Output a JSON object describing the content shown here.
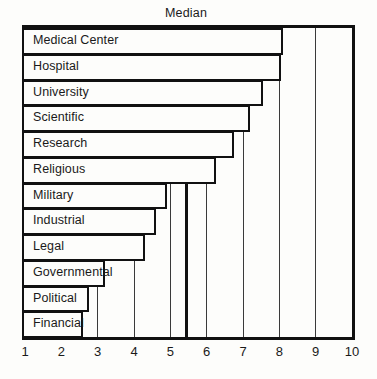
{
  "chart_data": {
    "type": "bar",
    "orientation": "horizontal",
    "title": "Median",
    "xlabel": "",
    "ylabel": "",
    "xlim": [
      1,
      10
    ],
    "xticks": [
      1,
      2,
      3,
      4,
      5,
      6,
      7,
      8,
      9,
      10
    ],
    "grid": true,
    "grid_axis": "x",
    "legend": false,
    "median_line": 5.45,
    "categories": [
      "Medical Center",
      "Hospital",
      "University",
      "Scientific",
      "Research",
      "Religious",
      "Military",
      "Industrial",
      "Legal",
      "Governmental",
      "Political",
      "Financial"
    ],
    "values": [
      8.1,
      8.05,
      7.55,
      7.2,
      6.75,
      6.25,
      4.9,
      4.6,
      4.3,
      3.2,
      2.75,
      2.6
    ],
    "colors": {
      "bar_fill": "#fdfdfb",
      "bar_outline": "#111111",
      "frame": "#111111",
      "grid": "#3a3a3a",
      "text": "#1a1a1a",
      "background": "#fdfdfb"
    }
  },
  "chart": {
    "title": "Median",
    "axis": {
      "ticks": [
        "1",
        "2",
        "3",
        "4",
        "5",
        "6",
        "7",
        "8",
        "9",
        "10"
      ]
    },
    "bars": [
      {
        "label": "Medical Center",
        "value": 8.1
      },
      {
        "label": "Hospital",
        "value": 8.05
      },
      {
        "label": "University",
        "value": 7.55
      },
      {
        "label": "Scientific",
        "value": 7.2
      },
      {
        "label": "Research",
        "value": 6.75
      },
      {
        "label": "Religious",
        "value": 6.25
      },
      {
        "label": "Military",
        "value": 4.9
      },
      {
        "label": "Industrial",
        "value": 4.6
      },
      {
        "label": "Legal",
        "value": 4.3
      },
      {
        "label": "Governmental",
        "value": 3.2
      },
      {
        "label": "Political",
        "value": 2.75
      },
      {
        "label": "Financial",
        "value": 2.6
      }
    ]
  }
}
